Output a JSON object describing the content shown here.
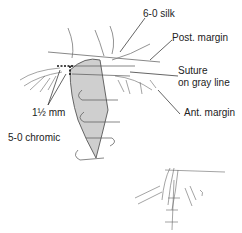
{
  "figure": {
    "labels": {
      "silk": "6-0 silk",
      "post_margin": "Post. margin",
      "suture_line1": "Suture",
      "suture_line2": "on gray line",
      "ant_margin": "Ant. margin",
      "mm": "1½ mm",
      "chromic": "5-0 chromic"
    },
    "colors": {
      "tarsus_fill": "#cfcfcf",
      "line": "#333333"
    }
  }
}
